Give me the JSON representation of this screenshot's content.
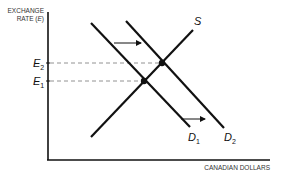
{
  "diagram": {
    "y_axis_label_line1": "EXCHANGE",
    "y_axis_label_line2": "RATE (",
    "y_axis_label_var": "E",
    "y_axis_label_close": ")",
    "x_axis_label": "CANADIAN DOLLARS",
    "levels": [
      {
        "label": "E",
        "sub": "2",
        "y": 63
      },
      {
        "label": "E",
        "sub": "1",
        "y": 81
      }
    ],
    "curves": [
      {
        "name": "S",
        "label": "S"
      },
      {
        "name": "D1",
        "label": "D",
        "sub": "1"
      },
      {
        "name": "D2",
        "label": "D",
        "sub": "2"
      }
    ],
    "colors": {
      "line": "#111111",
      "dash": "#777777",
      "text": "#222222"
    }
  }
}
